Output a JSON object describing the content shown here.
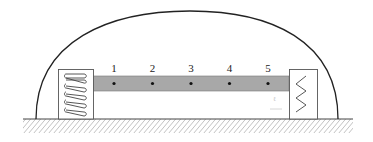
{
  "diagram": {
    "colors": {
      "line": "#333333",
      "bar_fill": "#a8a8a8",
      "box_stroke": "#555555",
      "hatch": "#666666",
      "dot": "#111111"
    },
    "points": [
      {
        "label": "1"
      },
      {
        "label": "2"
      },
      {
        "label": "3"
      },
      {
        "label": "4"
      },
      {
        "label": "5"
      }
    ],
    "left_support": {
      "type": "coil-spring"
    },
    "right_support": {
      "type": "zigzag-spring"
    },
    "faint_mark": "ℓ"
  }
}
